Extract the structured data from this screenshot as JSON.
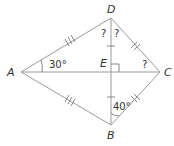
{
  "diagram": {
    "type": "kite",
    "stroke_color": "#9a9a9a",
    "text_color": "#333333",
    "vertices": {
      "A": {
        "label": "A",
        "x": 21,
        "y": 72
      },
      "B": {
        "label": "B",
        "x": 111,
        "y": 125
      },
      "C": {
        "label": "C",
        "x": 160,
        "y": 72
      },
      "D": {
        "label": "D",
        "x": 111,
        "y": 18
      },
      "E": {
        "label": "E",
        "x": 111,
        "y": 72
      }
    },
    "segments": [
      "AD",
      "DC",
      "CB",
      "BA",
      "AC",
      "DB"
    ],
    "congruence_marks": {
      "AD": "triple-tick",
      "AB": "triple-tick",
      "DC": "double-tick",
      "CB": "double-tick",
      "DE": "single-tick",
      "EB": "single-tick"
    },
    "right_angle_at": "E",
    "angles": {
      "DAC": "30°",
      "DBC": "40°",
      "ADE": "?",
      "EDC": "?",
      "ECD": "?"
    }
  }
}
